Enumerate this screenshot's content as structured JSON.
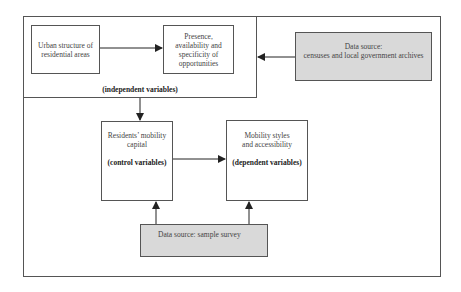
{
  "diagram": {
    "independent_group": {
      "label": "(independent variables)",
      "urban_structure": {
        "line1": "Urban structure of",
        "line2": "residential areas"
      },
      "opportunities": {
        "line1": "Presence,",
        "line2": "availability and",
        "line3": "specificity of",
        "line4": "opportunities"
      }
    },
    "data_source_top": {
      "line1": "Data source:",
      "line2": "censuses and local government archives"
    },
    "mobility_capital": {
      "line1": "Residents’ mobility",
      "line2": "capital",
      "role": "(control variables)"
    },
    "mobility_styles": {
      "line1": "Mobility styles",
      "line2": "and accessibility",
      "role": "(dependent variables)"
    },
    "data_source_bottom": {
      "label": "Data source: sample survey"
    },
    "colors": {
      "line": "#333333",
      "source_fill": "#d9d9d9"
    }
  }
}
